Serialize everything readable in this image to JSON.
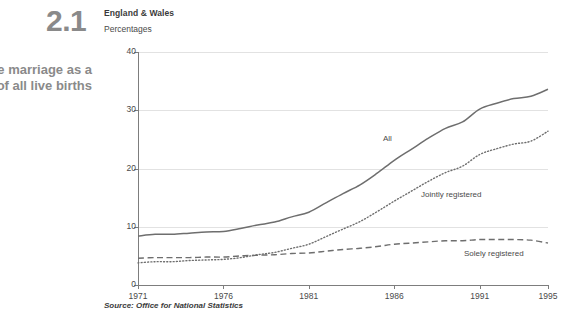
{
  "figure": {
    "number": "2.1",
    "title_line1": "de marriage as a",
    "title_line2": "of all live births",
    "region": "England & Wales",
    "units": "Percentages",
    "source": "Source: Office for National Statistics"
  },
  "chart_data": {
    "type": "line",
    "title": "England & Wales",
    "subtitle": "Percentages",
    "xlabel": "",
    "ylabel": "Percentages",
    "xlim": [
      1971,
      1995
    ],
    "ylim": [
      0,
      40
    ],
    "yticks": [
      0,
      10,
      20,
      30,
      40
    ],
    "ytick_labels": [
      "0",
      "10",
      "20",
      "30",
      "40"
    ],
    "xticks": [
      1971,
      1976,
      1981,
      1986,
      1991,
      1995
    ],
    "xtick_labels": [
      "1971",
      "1976",
      "1981",
      "1986",
      "1991",
      "1995"
    ],
    "grid": "horizontal",
    "legend": "inline-annotations",
    "x": [
      1971,
      1972,
      1973,
      1974,
      1975,
      1976,
      1977,
      1978,
      1979,
      1980,
      1981,
      1982,
      1983,
      1984,
      1985,
      1986,
      1987,
      1988,
      1989,
      1990,
      1991,
      1992,
      1993,
      1994,
      1995
    ],
    "series": [
      {
        "name": "All",
        "style": "solid",
        "color": "#6e6e6e",
        "values": [
          8.4,
          8.7,
          8.7,
          8.9,
          9.1,
          9.2,
          9.7,
          10.3,
          10.8,
          11.7,
          12.5,
          14.1,
          15.7,
          17.2,
          19.2,
          21.4,
          23.3,
          25.2,
          26.9,
          28.0,
          30.2,
          31.2,
          32.0,
          32.4,
          33.6
        ]
      },
      {
        "name": "Jointly registered",
        "style": "dotted",
        "color": "#6e6e6e",
        "values": [
          3.8,
          4.0,
          4.0,
          4.2,
          4.3,
          4.4,
          4.7,
          5.2,
          5.6,
          6.3,
          7.0,
          8.3,
          9.6,
          10.9,
          12.6,
          14.4,
          16.1,
          17.8,
          19.3,
          20.4,
          22.4,
          23.4,
          24.2,
          24.7,
          26.4
        ]
      },
      {
        "name": "Solely registered",
        "style": "dashed",
        "color": "#6e6e6e",
        "values": [
          4.6,
          4.7,
          4.7,
          4.7,
          4.8,
          4.8,
          5.0,
          5.1,
          5.2,
          5.4,
          5.5,
          5.8,
          6.1,
          6.3,
          6.6,
          7.0,
          7.2,
          7.4,
          7.6,
          7.6,
          7.8,
          7.8,
          7.8,
          7.7,
          7.2
        ]
      }
    ],
    "annotations": [
      {
        "text": "All",
        "x": 1986,
        "y": 19.5
      },
      {
        "text": "Jointly registered",
        "x": 1988,
        "y": 9.5
      },
      {
        "text": "Solely registered",
        "x": 1991,
        "y": 3.2
      }
    ]
  }
}
